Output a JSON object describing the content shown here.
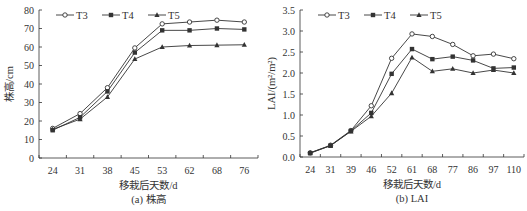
{
  "chart_data": [
    {
      "type": "line",
      "title": "(a) 株高",
      "xlabel": "移栽后天数/d",
      "ylabel": "株高/cm",
      "categories": [
        "24",
        "31",
        "38",
        "45",
        "53",
        "62",
        "68",
        "76"
      ],
      "ylim": [
        0,
        80
      ],
      "yticks": [
        0,
        10,
        20,
        30,
        40,
        50,
        60,
        70,
        80
      ],
      "grid": false,
      "legend_position": "top-inside",
      "series": [
        {
          "name": "T3",
          "marker": "open-circle",
          "values": [
            16,
            24,
            38,
            59.5,
            72.5,
            73.5,
            74.5,
            73.5
          ]
        },
        {
          "name": "T4",
          "marker": "filled-square",
          "values": [
            15,
            22,
            36,
            57,
            69,
            69,
            70,
            69.5
          ]
        },
        {
          "name": "T5",
          "marker": "filled-triangle",
          "values": [
            15.5,
            21,
            33,
            53.5,
            60,
            60.8,
            61,
            61.2
          ]
        }
      ]
    },
    {
      "type": "line",
      "title": "(b) LAI",
      "xlabel": "移栽后天数/d",
      "ylabel": "LAI/(m²/m²)",
      "categories": [
        "24",
        "31",
        "39",
        "46",
        "52",
        "61",
        "68",
        "77",
        "86",
        "97",
        "110"
      ],
      "ylim": [
        0,
        3.5
      ],
      "yticks": [
        "0.0",
        "0.5",
        "1.0",
        "1.5",
        "2.0",
        "2.5",
        "3.0",
        "3.5"
      ],
      "grid": false,
      "legend_position": "top-inside",
      "series": [
        {
          "name": "T3",
          "marker": "open-circle",
          "values": [
            0.1,
            0.28,
            0.63,
            1.22,
            2.35,
            2.93,
            2.87,
            2.68,
            2.41,
            2.45,
            2.34
          ]
        },
        {
          "name": "T4",
          "marker": "filled-square",
          "values": [
            0.09,
            0.27,
            0.62,
            1.05,
            1.98,
            2.57,
            2.33,
            2.39,
            2.3,
            2.11,
            2.13
          ]
        },
        {
          "name": "T5",
          "marker": "filled-triangle",
          "values": [
            0.1,
            0.27,
            0.61,
            0.97,
            1.52,
            2.37,
            2.04,
            2.1,
            2.0,
            2.07,
            2.0
          ]
        }
      ]
    }
  ],
  "colors": {
    "line": "#333333",
    "axis": "#333333",
    "text": "#333333"
  }
}
